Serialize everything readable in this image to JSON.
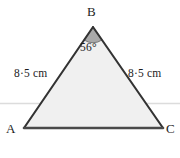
{
  "figure": {
    "type": "geometry-diagram",
    "shape": "isosceles-triangle",
    "width": 180,
    "height": 158,
    "background_color": "#ffffff",
    "fill_color": "#f0f0f0",
    "outline_color": "#333333",
    "base_color": "#4a4a4a",
    "angle_sector_color": "#a9a9a9",
    "angle_sector_outline": "#6e6e6e",
    "artifact_line_color": "#dcdcdc"
  },
  "vertices": {
    "a": {
      "label": "A",
      "x": 24,
      "y": 128
    },
    "b": {
      "label": "B",
      "x": 93,
      "y": 27
    },
    "c": {
      "label": "C",
      "x": 163,
      "y": 128
    }
  },
  "sides": {
    "ab": {
      "label": "8·5 cm",
      "value": 8.5,
      "unit": "cm"
    },
    "bc": {
      "label": "8·5 cm",
      "value": 8.5,
      "unit": "cm"
    }
  },
  "angles": {
    "b": {
      "label": "56°",
      "value": 56,
      "unit": "degrees",
      "marked": true
    }
  }
}
